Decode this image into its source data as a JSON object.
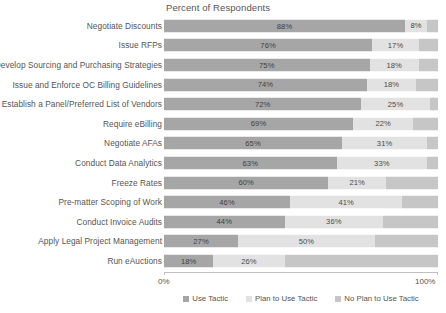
{
  "chart_data": {
    "type": "bar",
    "subtype": "stacked-horizontal-100",
    "title": "Percent of Respondents",
    "xlabel": "",
    "ylabel": "",
    "xlim": [
      0,
      100
    ],
    "x_ticks": [
      "0%",
      "100%"
    ],
    "grid": false,
    "legend_position": "bottom-center",
    "legend": [
      "Use Tactic",
      "Plan to Use Tactic",
      "No Plan to Use Tactic"
    ],
    "categories": [
      "Negotiate Discounts",
      "Issue RFPs",
      "Develop Sourcing and Purchasing Strategies",
      "Issue and Enforce OC Billing Guidelines",
      "Establish a Panel/Preferred List of Vendors",
      "Require eBilling",
      "Negotiate AFAs",
      "Conduct Data Analytics",
      "Freeze Rates",
      "Pre-matter Scoping of Work",
      "Conduct Invoice Audits",
      "Apply Legal Project Management",
      "Run eAuctions"
    ],
    "series": [
      {
        "name": "Use Tactic",
        "color": "#a6a6a6",
        "values": [
          88,
          76,
          75,
          74,
          72,
          69,
          65,
          63,
          60,
          46,
          44,
          27,
          18
        ],
        "labels": [
          "88%",
          "76%",
          "75%",
          "74%",
          "72%",
          "69%",
          "65%",
          "63%",
          "60%",
          "46%",
          "44%",
          "27%",
          "18%"
        ]
      },
      {
        "name": "Plan to Use Tactic",
        "color": "#e2e2e2",
        "values": [
          8,
          17,
          18,
          18,
          25,
          22,
          31,
          33,
          21,
          41,
          36,
          50,
          26
        ],
        "labels": [
          "8%",
          "17%",
          "18%",
          "18%",
          "25%",
          "22%",
          "31%",
          "33%",
          "21%",
          "41%",
          "36%",
          "50%",
          "26%"
        ]
      },
      {
        "name": "No Plan to Use Tactic",
        "color": "#c6c6c6",
        "values": [
          4,
          7,
          7,
          8,
          3,
          9,
          4,
          4,
          19,
          13,
          20,
          23,
          56
        ],
        "labels": [
          "",
          "",
          "",
          "",
          "",
          "",
          "",
          "",
          "",
          "",
          "",
          "",
          ""
        ]
      }
    ]
  },
  "axis": {
    "left_label": "0%",
    "right_label": "100%"
  }
}
